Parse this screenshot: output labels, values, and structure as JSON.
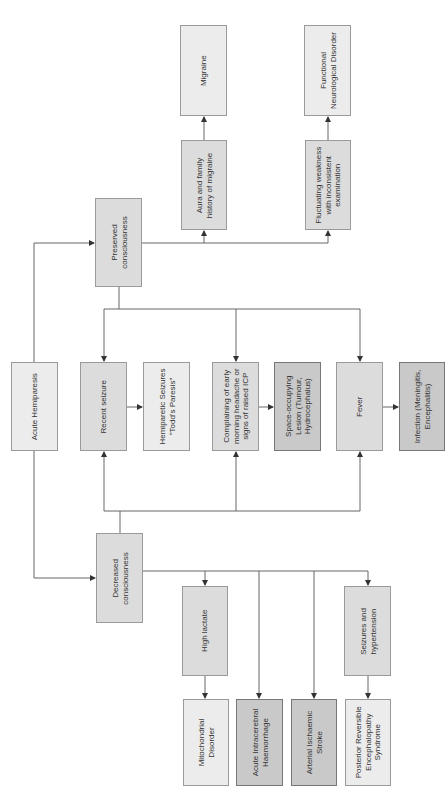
{
  "diagram": {
    "type": "flowchart",
    "orientation": "rotated-90-ccw",
    "colors": {
      "light": "#ececec",
      "mid": "#dcdcdc",
      "dark": "#c9c9c9",
      "line": "#555555"
    },
    "nodes": {
      "acute_hemiparesis": "Acute Hemiparesis",
      "preserved": "Preserved\nconsciousness",
      "decreased": "Decreased\nconsciousness",
      "aura": "Aura and family\nhistory of migraine",
      "migraine": "Migraine",
      "fluctuating": "Fluctuating weakness\nwith inconsistent\nexamination",
      "fnd": "Functional\nNeurological Disorder",
      "recent_seizure": "Recent seizure",
      "todds": "Hemiparetic Seizures\n\"Todd's Paresis\"",
      "complaining": "Complaining of early\nmorning headache or\nsigns of raised ICP",
      "sol": "Space-occupying\nLesion (Tumour,\nHydrocephalus)",
      "fever": "Fever",
      "infection": "Infection (Meningitis,\nEncephalitis)",
      "high_lactate": "High lactate",
      "mito": "Mitochondrial\nDisorder",
      "ich": "Acute Intracerebral\nHaemorrhage",
      "stroke": "Arterial Ischaemic\nStroke",
      "seiz_htn": "Seizures and\nhypertension",
      "pres": "Posterior Reversible\nEncephalopathy\nSyndrome"
    },
    "edges": [
      [
        "Acute Hemiparesis",
        "Preserved consciousness"
      ],
      [
        "Acute Hemiparesis",
        "Decreased consciousness"
      ],
      [
        "Preserved consciousness",
        "Aura and family history of migraine"
      ],
      [
        "Preserved consciousness",
        "Fluctuating weakness with inconsistent examination"
      ],
      [
        "Aura and family history of migraine",
        "Migraine"
      ],
      [
        "Fluctuating weakness with inconsistent examination",
        "Functional Neurological Disorder"
      ],
      [
        "Preserved consciousness",
        "Recent seizure"
      ],
      [
        "Preserved consciousness",
        "Complaining of early morning headache or signs of raised ICP"
      ],
      [
        "Preserved consciousness",
        "Fever"
      ],
      [
        "Decreased consciousness",
        "Recent seizure"
      ],
      [
        "Decreased consciousness",
        "Complaining of early morning headache or signs of raised ICP"
      ],
      [
        "Decreased consciousness",
        "Fever"
      ],
      [
        "Recent seizure",
        "Hemiparetic Seizures \"Todd's Paresis\""
      ],
      [
        "Complaining of early morning headache or signs of raised ICP",
        "Space-occupying Lesion (Tumour, Hydrocephalus)"
      ],
      [
        "Fever",
        "Infection (Meningitis, Encephalitis)"
      ],
      [
        "Decreased consciousness",
        "High lactate"
      ],
      [
        "Decreased consciousness",
        "Acute Intracerebral Haemorrhage"
      ],
      [
        "Decreased consciousness",
        "Arterial Ischaemic Stroke"
      ],
      [
        "Decreased consciousness",
        "Seizures and hypertension"
      ],
      [
        "High lactate",
        "Mitochondrial Disorder"
      ],
      [
        "Seizures and hypertension",
        "Posterior Reversible Encephalopathy Syndrome"
      ]
    ]
  }
}
